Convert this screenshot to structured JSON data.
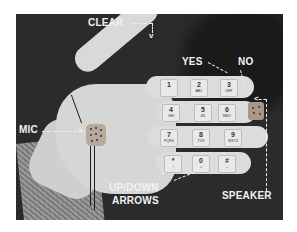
{
  "image": {
    "description": "Photo of a white glove with a phone keypad printed on the fingers, with labeled features",
    "labels": {
      "clear": "CLEAR",
      "yes": "YES",
      "no": "NO",
      "mic": "MIC",
      "speaker": "SPEAKER",
      "arrows_line1": "UP/DOWN",
      "arrows_line2": "ARROWS"
    },
    "keypad": [
      [
        {
          "num": "1",
          "letters": ""
        },
        {
          "num": "2",
          "letters": "ABC"
        },
        {
          "num": "3",
          "letters": "DEF"
        }
      ],
      [
        {
          "num": "4",
          "letters": "GHI"
        },
        {
          "num": "5",
          "letters": "JKL"
        },
        {
          "num": "6",
          "letters": "MNO"
        }
      ],
      [
        {
          "num": "7",
          "letters": "PQRS"
        },
        {
          "num": "8",
          "letters": "TUV"
        },
        {
          "num": "9",
          "letters": "WXYZ"
        }
      ],
      [
        {
          "num": "*",
          "letters": "↑"
        },
        {
          "num": "0",
          "letters": "+"
        },
        {
          "num": "#",
          "letters": "↓"
        }
      ]
    ],
    "colors": {
      "background": "#2b2b2b",
      "glove": "#d8d8d8",
      "label_text": "#f2f2f2"
    }
  }
}
